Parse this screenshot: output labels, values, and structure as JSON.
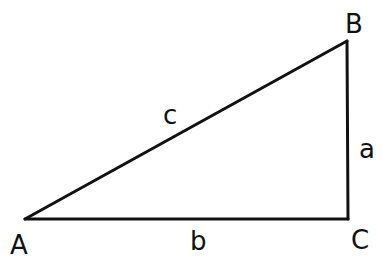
{
  "diagram": {
    "type": "right-triangle",
    "vertices": [
      {
        "id": "A",
        "label": "A",
        "x": 25,
        "y": 219,
        "lx": 10,
        "ly": 254
      },
      {
        "id": "B",
        "label": "B",
        "x": 347,
        "y": 41,
        "lx": 345,
        "ly": 33
      },
      {
        "id": "C",
        "label": "C",
        "x": 348,
        "y": 219,
        "lx": 351,
        "ly": 249
      }
    ],
    "sides": [
      {
        "id": "c",
        "label": "c",
        "from": "A",
        "to": "B",
        "lx": 163,
        "ly": 124
      },
      {
        "id": "a",
        "label": "a",
        "from": "B",
        "to": "C",
        "lx": 359,
        "ly": 158
      },
      {
        "id": "b",
        "label": "b",
        "from": "A",
        "to": "C",
        "lx": 190,
        "ly": 250
      }
    ],
    "right_angle_at": "C",
    "stroke_color": "#111111"
  }
}
